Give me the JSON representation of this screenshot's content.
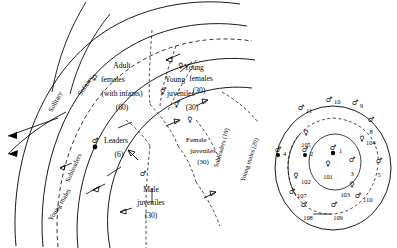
{
  "figure": {
    "panels": [
      "left-troop-rings",
      "right-individuals"
    ]
  },
  "left_panel": {
    "name": "concentric-troop-structure",
    "outer_flow_labels": [
      {
        "id": "solitary-1",
        "text": "Solitary"
      },
      {
        "id": "solitary-2",
        "text": "Solitary"
      }
    ],
    "arc_labels": [
      {
        "id": "subleaders-arc",
        "text": "Subleaders"
      },
      {
        "id": "young-males-arc",
        "text": "Young males"
      },
      {
        "id": "subleaders-count-arc",
        "text": "Subleaders (10)"
      },
      {
        "id": "young-males-count-arc",
        "text": "Young males (20)"
      }
    ],
    "groups": [
      {
        "id": "adult-females",
        "symbol": "♀",
        "lines": [
          "Adult",
          "females",
          "(with infants)"
        ],
        "count": "(60)"
      },
      {
        "id": "young-juveniles",
        "symbol": "⚥",
        "lines": [
          "Young",
          "juveniles"
        ],
        "count": "(30)"
      },
      {
        "id": "young-females",
        "symbol": "♀",
        "lines": [
          "Young",
          "females"
        ],
        "count": "(30)"
      },
      {
        "id": "female-juveniles",
        "symbol": "♀",
        "lines": [
          "Female",
          "juveniles"
        ],
        "count": "(30)"
      },
      {
        "id": "male-juveniles",
        "symbol": "♂",
        "lines": [
          "Male",
          "juveniles"
        ],
        "count": "(30)"
      },
      {
        "id": "leaders",
        "symbol": "♂",
        "lines": [
          "Leaders"
        ],
        "count": "(6)"
      }
    ]
  },
  "right_panel": {
    "name": "individual-positions",
    "individuals": [
      {
        "id": "i1",
        "label": "1",
        "sex": "male-leader"
      },
      {
        "id": "i2",
        "label": "2",
        "sex": "male-leader"
      },
      {
        "id": "i3",
        "label": "3",
        "sex": "male"
      },
      {
        "id": "i4",
        "label": "4",
        "sex": "male-leader"
      },
      {
        "id": "i5",
        "label": "5",
        "sex": "male"
      },
      {
        "id": "i8",
        "label": "8",
        "sex": "male"
      },
      {
        "id": "i9",
        "label": "9",
        "sex": "male"
      },
      {
        "id": "i10",
        "label": "10",
        "sex": "male"
      },
      {
        "id": "i11",
        "label": "11",
        "sex": "male"
      },
      {
        "id": "i101",
        "label": "101",
        "sex": "female"
      },
      {
        "id": "i102",
        "label": "102",
        "sex": "female"
      },
      {
        "id": "i103",
        "label": "103",
        "sex": "female"
      },
      {
        "id": "i104",
        "label": "104",
        "sex": "female"
      },
      {
        "id": "i105",
        "label": "105",
        "sex": "female"
      },
      {
        "id": "i107",
        "label": "107",
        "sex": "male"
      },
      {
        "id": "i108",
        "label": "108",
        "sex": "male"
      },
      {
        "id": "i109",
        "label": "109",
        "sex": "male"
      },
      {
        "id": "i110",
        "label": "110",
        "sex": "male"
      }
    ]
  },
  "colors": {
    "ink": "#000000",
    "paper": "#ffffff"
  }
}
